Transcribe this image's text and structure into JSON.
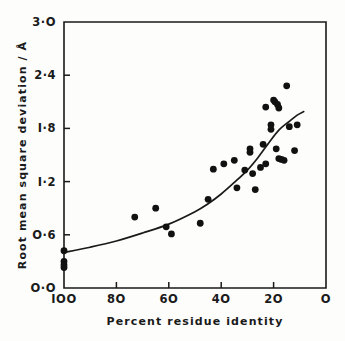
{
  "figure": {
    "background": "#fdfdfc",
    "ink": "#1a1a1a"
  },
  "chart_data": {
    "type": "scatter",
    "title": "",
    "xlabel": "Percent  residue  identity",
    "ylabel": "Root mean square deviation / Å",
    "xlim": [
      100,
      0
    ],
    "ylim": [
      0.0,
      3.0
    ],
    "x_reversed": true,
    "grid": false,
    "legend": null,
    "xticks": [
      100,
      80,
      60,
      40,
      20,
      0
    ],
    "xticklabels": [
      "IOO",
      "8O",
      "6O",
      "4O",
      "2O",
      "O"
    ],
    "yticks": [
      0.0,
      0.6,
      1.2,
      1.8,
      2.4,
      3.0
    ],
    "yticklabels": [
      "O·O",
      "O·6",
      "I·2",
      "I·8",
      "2·4",
      "3·O"
    ],
    "marker": "filled-circle",
    "marker_color": "#111111",
    "marker_radius_px": 3.4,
    "points": [
      {
        "x": 100.0,
        "y": 0.42
      },
      {
        "x": 100.0,
        "y": 0.3
      },
      {
        "x": 100.0,
        "y": 0.26
      },
      {
        "x": 100.0,
        "y": 0.23
      },
      {
        "x": 73.0,
        "y": 0.8
      },
      {
        "x": 65.0,
        "y": 0.9
      },
      {
        "x": 61.0,
        "y": 0.69
      },
      {
        "x": 59.0,
        "y": 0.61
      },
      {
        "x": 48.0,
        "y": 0.73
      },
      {
        "x": 45.0,
        "y": 1.0
      },
      {
        "x": 43.0,
        "y": 1.34
      },
      {
        "x": 39.0,
        "y": 1.4
      },
      {
        "x": 35.0,
        "y": 1.44
      },
      {
        "x": 34.0,
        "y": 1.13
      },
      {
        "x": 31.0,
        "y": 1.33
      },
      {
        "x": 29.0,
        "y": 1.57
      },
      {
        "x": 29.0,
        "y": 1.53
      },
      {
        "x": 28.0,
        "y": 1.29
      },
      {
        "x": 27.0,
        "y": 1.11
      },
      {
        "x": 25.0,
        "y": 1.36
      },
      {
        "x": 24.0,
        "y": 1.62
      },
      {
        "x": 23.0,
        "y": 1.4
      },
      {
        "x": 23.0,
        "y": 2.04
      },
      {
        "x": 21.0,
        "y": 1.84
      },
      {
        "x": 21.0,
        "y": 1.79
      },
      {
        "x": 20.0,
        "y": 2.12
      },
      {
        "x": 19.5,
        "y": 2.1
      },
      {
        "x": 19.0,
        "y": 1.57
      },
      {
        "x": 18.5,
        "y": 2.07
      },
      {
        "x": 18.0,
        "y": 2.03
      },
      {
        "x": 18.0,
        "y": 1.46
      },
      {
        "x": 17.0,
        "y": 1.45
      },
      {
        "x": 16.0,
        "y": 1.44
      },
      {
        "x": 15.0,
        "y": 2.28
      },
      {
        "x": 14.0,
        "y": 1.82
      },
      {
        "x": 12.0,
        "y": 1.55
      },
      {
        "x": 11.0,
        "y": 1.84
      }
    ],
    "fit_curve": {
      "description": "smooth increasing trend from high to low residue identity",
      "points": [
        {
          "x": 100.0,
          "y": 0.4
        },
        {
          "x": 90.0,
          "y": 0.46
        },
        {
          "x": 80.0,
          "y": 0.53
        },
        {
          "x": 70.0,
          "y": 0.62
        },
        {
          "x": 60.0,
          "y": 0.72
        },
        {
          "x": 50.0,
          "y": 0.86
        },
        {
          "x": 45.0,
          "y": 0.95
        },
        {
          "x": 40.0,
          "y": 1.06
        },
        {
          "x": 35.0,
          "y": 1.19
        },
        {
          "x": 30.0,
          "y": 1.33
        },
        {
          "x": 26.0,
          "y": 1.47
        },
        {
          "x": 22.0,
          "y": 1.63
        },
        {
          "x": 18.0,
          "y": 1.78
        },
        {
          "x": 14.0,
          "y": 1.88
        },
        {
          "x": 11.0,
          "y": 1.95
        },
        {
          "x": 8.5,
          "y": 1.99
        }
      ]
    }
  }
}
